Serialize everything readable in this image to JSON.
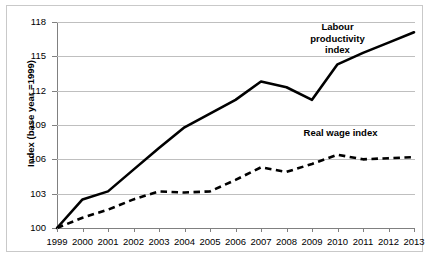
{
  "chart_data": {
    "type": "line",
    "title": "",
    "xlabel": "",
    "ylabel": "Index (base year =1999)",
    "categories": [
      "1999",
      "2000",
      "2001",
      "2002",
      "2003",
      "2004",
      "2005",
      "2006",
      "2007",
      "2008",
      "2009",
      "2010",
      "2011",
      "2012",
      "2013"
    ],
    "x": [
      1999,
      2000,
      2001,
      2002,
      2003,
      2004,
      2005,
      2006,
      2007,
      2008,
      2009,
      2010,
      2011,
      2012,
      2013
    ],
    "ylim": [
      100,
      118
    ],
    "yticks": [
      100,
      103,
      106,
      109,
      112,
      115,
      118
    ],
    "grid": true,
    "legend_position": "inline-annotations",
    "series": [
      {
        "name": "Labour productivity index",
        "style": "solid",
        "color": "#000000",
        "values": [
          100.0,
          102.5,
          103.2,
          105.1,
          107.0,
          108.8,
          110.0,
          111.2,
          112.8,
          112.3,
          111.2,
          114.3,
          115.3,
          116.2,
          117.1
        ]
      },
      {
        "name": "Real wage index",
        "style": "dashed",
        "color": "#000000",
        "values": [
          100.0,
          100.9,
          101.6,
          102.5,
          103.2,
          103.1,
          103.2,
          104.2,
          105.3,
          104.9,
          105.6,
          106.4,
          106.0,
          106.1,
          106.2
        ]
      }
    ],
    "annotations": [
      {
        "text": "Labour\nproductivity\nindex",
        "x": 2010,
        "y": 117.0
      },
      {
        "text": "Real wage index",
        "x": 2010.2,
        "y": 108.3
      }
    ]
  },
  "axes": {
    "y_title": "Index (base year =1999)",
    "y_tick_labels": [
      "118",
      "115",
      "112",
      "109",
      "106",
      "103",
      "100"
    ],
    "x_tick_labels": [
      "1999",
      "2000",
      "2001",
      "2002",
      "2003",
      "2004",
      "2005",
      "2006",
      "2007",
      "2008",
      "2009",
      "2010",
      "2011",
      "2012",
      "2013"
    ]
  },
  "labels": {
    "labour_productivity": "Labour\nproductivity\nindex",
    "real_wage": "Real wage index"
  },
  "colors": {
    "series": "#000000",
    "gridline": "#bfbfbf",
    "axis": "#808080",
    "frame": "#c9c9c9",
    "background": "#ffffff"
  }
}
